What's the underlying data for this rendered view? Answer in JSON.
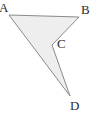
{
  "figure": {
    "name": "concave-quadrilateral-abcd",
    "shape_type": "polygon",
    "vertex_count": 4,
    "fill_color": "#eeeeee",
    "stroke_color": "#8a8a8a",
    "stroke_width": 1,
    "background_color": "#ffffff",
    "label_color": "#2b2b2b",
    "canvas": {
      "width": 98,
      "height": 115
    },
    "vertices": [
      {
        "id": "A",
        "label": "A",
        "x": 9,
        "y": 15,
        "kind": "convex",
        "label_x": -1,
        "label_y": 1
      },
      {
        "id": "B",
        "label": "B",
        "x": 79,
        "y": 17,
        "kind": "convex",
        "label_x": 81,
        "label_y": 3
      },
      {
        "id": "C",
        "label": "C",
        "x": 52,
        "y": 45,
        "kind": "reflex",
        "label_x": 57,
        "label_y": 37
      },
      {
        "id": "D",
        "label": "D",
        "x": 70,
        "y": 96,
        "kind": "convex",
        "label_x": 70,
        "label_y": 99
      }
    ],
    "edges": [
      {
        "from": "A",
        "to": "B"
      },
      {
        "from": "B",
        "to": "C"
      },
      {
        "from": "C",
        "to": "D"
      },
      {
        "from": "D",
        "to": "A"
      }
    ],
    "path": "M 9,15 L 79,17 L 52,45 L 70,96 Z",
    "labels": {
      "A": "A",
      "B": "B",
      "C": "C",
      "D": "D"
    }
  }
}
